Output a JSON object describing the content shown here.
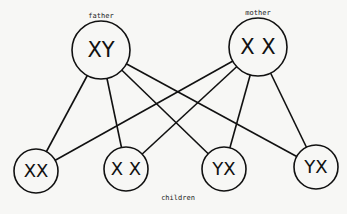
{
  "diagram": {
    "type": "inheritance-cross",
    "parents": [
      {
        "id": "father",
        "label": "father",
        "genotype": "XY",
        "cx": 101,
        "cy": 50,
        "r": 29,
        "label_x": 101,
        "label_y": 18
      },
      {
        "id": "mother",
        "label": "mother",
        "genotype": "X X",
        "cx": 258,
        "cy": 47,
        "r": 29,
        "label_x": 258,
        "label_y": 15
      }
    ],
    "children_label": {
      "text": "children",
      "x": 178,
      "y": 200
    },
    "children": [
      {
        "id": "child1",
        "genotype": "XX",
        "cx": 36,
        "cy": 171,
        "r": 22
      },
      {
        "id": "child2",
        "genotype": "X X",
        "cx": 126,
        "cy": 169,
        "r": 22
      },
      {
        "id": "child3",
        "genotype": "YX",
        "cx": 224,
        "cy": 169,
        "r": 22
      },
      {
        "id": "child4",
        "genotype": "YX",
        "cx": 316,
        "cy": 167,
        "r": 22
      }
    ],
    "edges": [
      {
        "from": "father",
        "to": "child1"
      },
      {
        "from": "father",
        "to": "child2"
      },
      {
        "from": "father",
        "to": "child3"
      },
      {
        "from": "father",
        "to": "child4"
      },
      {
        "from": "mother",
        "to": "child1"
      },
      {
        "from": "mother",
        "to": "child2"
      },
      {
        "from": "mother",
        "to": "child3"
      },
      {
        "from": "mother",
        "to": "child4"
      }
    ]
  }
}
